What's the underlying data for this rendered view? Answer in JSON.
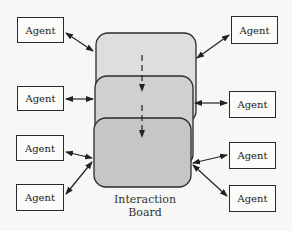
{
  "diagram": {
    "board": {
      "caption_line1": "Interaction",
      "caption_line2": "Board",
      "layers": 3,
      "layer_colors": [
        "#dcdcda",
        "#cfcfcd",
        "#c4c4c2"
      ]
    },
    "agents_left": [
      {
        "label": "Agent"
      },
      {
        "label": "Agent"
      },
      {
        "label": "Agent"
      },
      {
        "label": "Agent"
      }
    ],
    "agents_right": [
      {
        "label": "Agent"
      },
      {
        "label": "Agent"
      },
      {
        "label": "Agent"
      },
      {
        "label": "Agent"
      }
    ]
  }
}
